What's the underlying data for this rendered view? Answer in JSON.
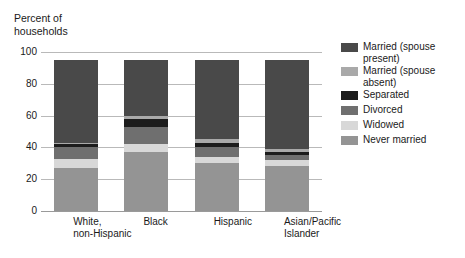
{
  "axis_title": "Percent of\nhouseholds",
  "legend": {
    "items": [
      {
        "label": "Married (spouse\npresent)",
        "key": "married_present",
        "color": "#494949"
      },
      {
        "label": "Married (spouse\nabsent)",
        "key": "married_absent",
        "color": "#a9a9a9"
      },
      {
        "label": "Separated",
        "key": "separated",
        "color": "#1c1c1c"
      },
      {
        "label": "Divorced",
        "key": "divorced",
        "color": "#6f6f6f"
      },
      {
        "label": "Widowed",
        "key": "widowed",
        "color": "#d8d8d8"
      },
      {
        "label": "Never married",
        "key": "never_married",
        "color": "#949494"
      }
    ]
  },
  "chart_data": {
    "type": "bar",
    "subtype": "stacked",
    "title": "",
    "xlabel": "",
    "ylabel": "Percent of households",
    "ylim": [
      0,
      100
    ],
    "yticks": [
      0,
      20,
      40,
      60,
      80,
      100
    ],
    "ytick_labels": [
      "0",
      "20",
      "40",
      "60",
      "80",
      "100"
    ],
    "grid": true,
    "legend_position": "right",
    "categories": [
      "White,\nnon-Hispanic",
      "Black",
      "Hispanic",
      "Asian/Pacific\nIslander"
    ],
    "category_plain": [
      "White, non-Hispanic",
      "Black",
      "Hispanic",
      "Asian/Pacific Islander"
    ],
    "stack_order_bottom_to_top": [
      "never_married",
      "widowed",
      "divorced",
      "separated",
      "married_absent",
      "married_present"
    ],
    "series": [
      {
        "name": "Never married",
        "key": "never_married",
        "color": "#949494",
        "values": [
          27,
          37,
          30,
          28
        ]
      },
      {
        "name": "Widowed",
        "key": "widowed",
        "color": "#d8d8d8",
        "values": [
          6,
          5,
          4,
          4
        ]
      },
      {
        "name": "Divorced",
        "key": "divorced",
        "color": "#6f6f6f",
        "values": [
          7,
          11,
          6,
          3
        ]
      },
      {
        "name": "Separated",
        "key": "separated",
        "color": "#1c1c1c",
        "values": [
          2,
          5,
          3,
          2
        ]
      },
      {
        "name": "Married (spouse absent)",
        "key": "married_absent",
        "color": "#a9a9a9",
        "values": [
          1,
          2,
          2,
          2
        ]
      },
      {
        "name": "Married (spouse present)",
        "key": "married_present",
        "color": "#494949",
        "values": [
          52,
          35,
          50,
          56
        ]
      }
    ]
  },
  "colors": {
    "gridline": "#b9b9b9",
    "baseline": "#9a9a9a",
    "text": "#1a1a1a",
    "background": "#ffffff"
  }
}
